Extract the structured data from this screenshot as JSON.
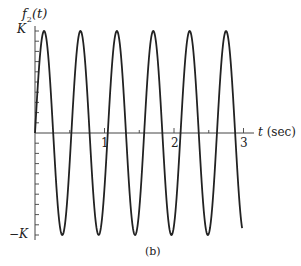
{
  "chart_data": {
    "type": "line",
    "title": "",
    "ylabel_main": "f",
    "ylabel_sub": "2",
    "ylabel_arg": "(t)",
    "xlabel": "t (sec)",
    "xlabel_var": "t",
    "xlabel_unit": "(sec)",
    "x_ticks": [
      1,
      2,
      3
    ],
    "x_tick_labels": [
      "1",
      "2",
      "3"
    ],
    "y_tick_labels": {
      "top": "K",
      "bottom": "−K"
    },
    "ylim": [
      -1,
      1
    ],
    "xlim": [
      0,
      3.15
    ],
    "grid": false,
    "caption": "(b)",
    "function": "K sin(12 t)",
    "amplitude": "K",
    "angular_frequency_rad_per_s": 12,
    "period_sec": 0.524,
    "t_start": 0,
    "t_end": 2.98,
    "series": [
      {
        "name": "f2(t)",
        "x": [
          0,
          0.131,
          0.262,
          0.393,
          0.524,
          0.654,
          0.785,
          0.916,
          1.047,
          1.178,
          1.309,
          1.44,
          1.571,
          1.702,
          1.833,
          1.963,
          2.094,
          2.225,
          2.356,
          2.487,
          2.618,
          2.749,
          2.88,
          2.98
        ],
        "values": [
          0,
          1,
          0,
          -1,
          0,
          1,
          0,
          -1,
          0,
          1,
          0,
          -1,
          0,
          1,
          0,
          -1,
          0,
          1,
          0,
          -1,
          0,
          1,
          0,
          -1
        ]
      }
    ]
  }
}
